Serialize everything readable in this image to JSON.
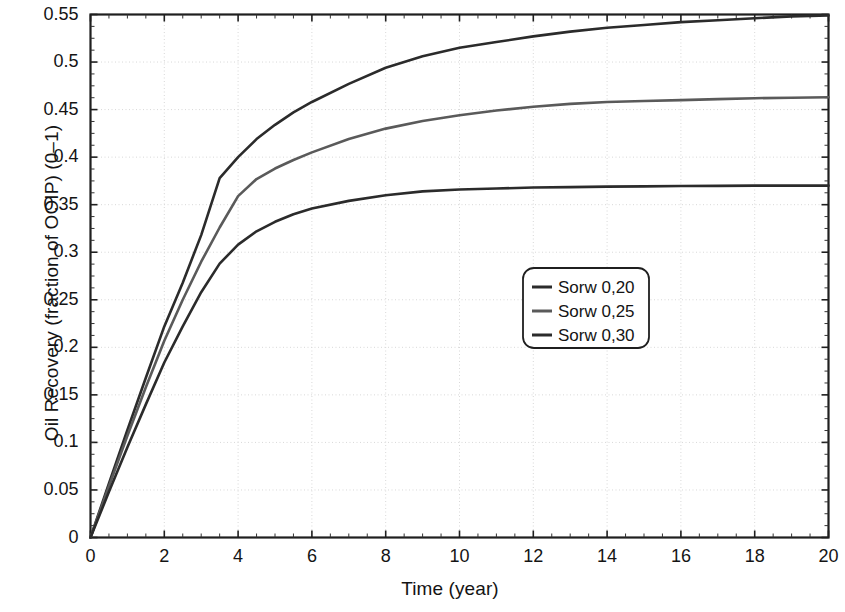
{
  "chart_data": {
    "type": "line",
    "title": "",
    "xlabel": "Time (year)",
    "ylabel": "Oil Recovery (fraction of OOIP) (0–1)",
    "xlim": [
      0,
      20
    ],
    "ylim": [
      0,
      0.55
    ],
    "xticks": [
      0,
      2,
      4,
      6,
      8,
      10,
      12,
      14,
      16,
      18,
      20
    ],
    "xtick_labels": [
      "0",
      "2",
      "4",
      "6",
      "8",
      "10",
      "12",
      "14",
      "16",
      "18",
      "20"
    ],
    "yticks": [
      0,
      0.05,
      0.1,
      0.15,
      0.2,
      0.25,
      0.3,
      0.35,
      0.4,
      0.45,
      0.5,
      0.55
    ],
    "ytick_labels": [
      "0",
      "0.05",
      "0.1",
      "0.15",
      "0.2",
      "0.25",
      "0.3",
      "0.35",
      "0.4",
      "0.45",
      "0.5",
      "0.55"
    ],
    "grid": true,
    "grid_style": "dotted",
    "minor_ticks": true,
    "legend_position": "center-right",
    "x": [
      0,
      0.5,
      1,
      1.5,
      2,
      2.5,
      3,
      3.5,
      4,
      4.5,
      5,
      5.5,
      6,
      7,
      8,
      9,
      10,
      11,
      12,
      13,
      14,
      15,
      16,
      17,
      18,
      19,
      20
    ],
    "series": [
      {
        "name": "Sorw 0,20",
        "color": "#2b2b2b",
        "values": [
          0,
          0.057,
          0.113,
          0.168,
          0.222,
          0.268,
          0.318,
          0.378,
          0.4,
          0.419,
          0.434,
          0.447,
          0.458,
          0.477,
          0.494,
          0.506,
          0.515,
          0.521,
          0.527,
          0.532,
          0.536,
          0.539,
          0.542,
          0.544,
          0.546,
          0.548,
          0.549
        ]
      },
      {
        "name": "Sorw 0,25",
        "color": "#5a5a5a",
        "values": [
          0,
          0.054,
          0.107,
          0.158,
          0.207,
          0.25,
          0.29,
          0.326,
          0.359,
          0.377,
          0.388,
          0.397,
          0.405,
          0.419,
          0.43,
          0.438,
          0.444,
          0.449,
          0.453,
          0.456,
          0.458,
          0.459,
          0.46,
          0.461,
          0.462,
          0.4625,
          0.463
        ]
      },
      {
        "name": "Sorw 0,30",
        "color": "#2b2b2b",
        "values": [
          0,
          0.048,
          0.095,
          0.14,
          0.184,
          0.222,
          0.258,
          0.288,
          0.308,
          0.322,
          0.332,
          0.34,
          0.346,
          0.354,
          0.36,
          0.364,
          0.366,
          0.367,
          0.368,
          0.3685,
          0.369,
          0.3693,
          0.3696,
          0.3698,
          0.37,
          0.37,
          0.37
        ]
      }
    ],
    "legend_entries": [
      {
        "label": "Sorw 0,20",
        "color": "#2b2b2b"
      },
      {
        "label": "Sorw 0,25",
        "color": "#5a5a5a"
      },
      {
        "label": "Sorw 0,30",
        "color": "#2b2b2b"
      }
    ]
  }
}
